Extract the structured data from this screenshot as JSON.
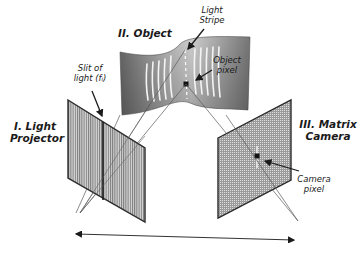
{
  "diagram": {
    "type": "structured-light-triangulation",
    "components": [
      {
        "id": "projector",
        "title_line1": "I. Light",
        "title_line2": "Projector"
      },
      {
        "id": "object",
        "title": "II. Object"
      },
      {
        "id": "camera",
        "title_line1": "III. Matrix",
        "title_line2": "Camera"
      }
    ],
    "annotations": {
      "slit_line1": "Slit of",
      "slit_line2": "light (fᵢ)",
      "stripe_line1": "Light",
      "stripe_line2": "Stripe",
      "object_pixel_line1": "Object",
      "object_pixel_line2": "pixel",
      "camera_pixel_line1": "Camera",
      "camera_pixel_line2": "pixel"
    },
    "colors": {
      "panel_fill": "#b8b8b8",
      "panel_edge": "#2a2a2a",
      "object_fill": "#8a8a8a",
      "stripe": "#f5f5f5",
      "ray": "#555555"
    },
    "baseline_arrow": "bidirectional"
  }
}
